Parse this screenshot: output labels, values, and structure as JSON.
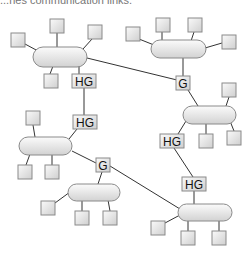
{
  "caption": "...nes communication links.",
  "labels": {
    "hg": "HG",
    "g": "G"
  },
  "gateways": [
    {
      "id": "hg-top-left",
      "type": "HG",
      "label": "HG"
    },
    {
      "id": "g-top-right",
      "type": "G",
      "label": "G"
    },
    {
      "id": "hg-left-mid",
      "type": "HG",
      "label": "HG"
    },
    {
      "id": "hg-right-mid",
      "type": "HG",
      "label": "HG"
    },
    {
      "id": "g-lower-mid",
      "type": "G",
      "label": "G"
    },
    {
      "id": "hg-bottom-right",
      "type": "HG",
      "label": "HG"
    }
  ],
  "networks": [
    {
      "id": "net-top-left",
      "hosts": 4
    },
    {
      "id": "net-top-right",
      "hosts": 4
    },
    {
      "id": "net-right-mid",
      "hosts": 3
    },
    {
      "id": "net-left-mid",
      "hosts": 3
    },
    {
      "id": "net-bottom-left",
      "hosts": 3
    },
    {
      "id": "net-bottom-right",
      "hosts": 3
    }
  ],
  "colors": {
    "line": "#333333",
    "shape_border": "#8a8a8a",
    "fill_light": "#f7f7f7",
    "fill_dark": "#d4d4d4"
  }
}
